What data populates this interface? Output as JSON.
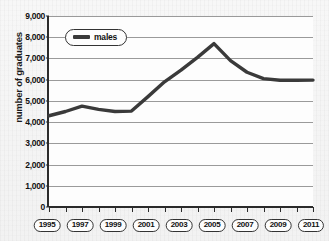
{
  "chart_data": {
    "type": "line",
    "title": "",
    "xlabel": "",
    "ylabel": "number of graduates",
    "legend_position": "top-left",
    "grid": true,
    "xlim": [
      1995,
      2011
    ],
    "ylim": [
      0,
      9000
    ],
    "y_ticks": [
      "9,000",
      "8,000",
      "7,000",
      "6,000",
      "5,000",
      "4,000",
      "3,000",
      "2,000",
      "1,000",
      "0"
    ],
    "y_tick_values": [
      9000,
      8000,
      7000,
      6000,
      5000,
      4000,
      3000,
      2000,
      1000,
      0
    ],
    "x_tick_labels": [
      "1995",
      "1997",
      "1999",
      "2001",
      "2003",
      "2005",
      "2007",
      "2009",
      "2011"
    ],
    "x_tick_values": [
      1995,
      1997,
      1999,
      2001,
      2003,
      2005,
      2007,
      2009,
      2011
    ],
    "x_minor_ticks": [
      1995,
      1996,
      1997,
      1998,
      1999,
      2000,
      2001,
      2002,
      2003,
      2004,
      2005,
      2006,
      2007,
      2008,
      2009,
      2010,
      2011
    ],
    "series": [
      {
        "name": "males",
        "color": "#3a3a3a",
        "x": [
          1995,
          1996,
          1997,
          1998,
          1999,
          2000,
          2001,
          2002,
          2003,
          2004,
          2005,
          2006,
          2007,
          2008,
          2009,
          2010,
          2011
        ],
        "values": [
          4300,
          4500,
          4750,
          4600,
          4500,
          4520,
          5200,
          5900,
          6450,
          7050,
          7700,
          6900,
          6350,
          6050,
          5970,
          5970,
          5980
        ]
      }
    ]
  },
  "legend": {
    "entries": [
      {
        "label": "males",
        "swatch": "line-swatch"
      }
    ]
  },
  "axes": {
    "y_title": "number of graduates"
  }
}
